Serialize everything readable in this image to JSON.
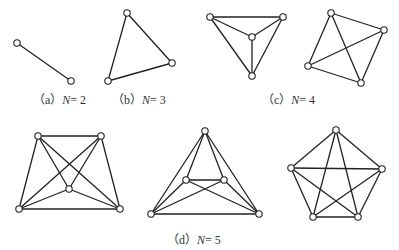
{
  "colors": {
    "line": "#222222",
    "node_fill": "#ffffff",
    "text": "#333333"
  },
  "node_radius": 3.2,
  "captions": [
    {
      "id": "a",
      "prefix": "（a）",
      "var": "N",
      "suffix": "= 2",
      "x": 33,
      "y": 104
    },
    {
      "id": "b",
      "prefix": "（b）",
      "var": "N",
      "suffix": "= 3",
      "x": 112,
      "y": 104
    },
    {
      "id": "c",
      "prefix": "（c）",
      "var": "N",
      "suffix": "= 4",
      "x": 262,
      "y": 104
    },
    {
      "id": "d",
      "prefix": "（d）",
      "var": "N",
      "suffix": "= 5",
      "x": 167,
      "y": 244
    }
  ],
  "graphs": [
    {
      "name": "graph-n2",
      "nodes": [
        [
          17,
          43
        ],
        [
          71,
          81
        ]
      ],
      "edges": [
        [
          0,
          1
        ]
      ]
    },
    {
      "name": "graph-n3",
      "nodes": [
        [
          127,
          13
        ],
        [
          172,
          63
        ],
        [
          108,
          81
        ]
      ],
      "edges": [
        [
          0,
          1
        ],
        [
          1,
          2
        ],
        [
          2,
          0
        ]
      ]
    },
    {
      "name": "graph-n4-planar",
      "nodes": [
        [
          210,
          17
        ],
        [
          283,
          17
        ],
        [
          252,
          37
        ],
        [
          252,
          76
        ]
      ],
      "edges": [
        [
          0,
          1
        ],
        [
          0,
          2
        ],
        [
          0,
          3
        ],
        [
          1,
          2
        ],
        [
          1,
          3
        ],
        [
          2,
          3
        ]
      ]
    },
    {
      "name": "graph-n4-square",
      "nodes": [
        [
          331,
          13
        ],
        [
          384,
          30
        ],
        [
          308,
          66
        ],
        [
          361,
          83
        ]
      ],
      "edges": [
        [
          0,
          1
        ],
        [
          0,
          2
        ],
        [
          0,
          3
        ],
        [
          1,
          2
        ],
        [
          1,
          3
        ],
        [
          2,
          3
        ]
      ]
    },
    {
      "name": "graph-n5-trapezoid",
      "nodes": [
        [
          38,
          136
        ],
        [
          101,
          136
        ],
        [
          69,
          189
        ],
        [
          19,
          209
        ],
        [
          120,
          209
        ]
      ],
      "edges": [
        [
          0,
          1
        ],
        [
          0,
          2
        ],
        [
          0,
          3
        ],
        [
          0,
          4
        ],
        [
          1,
          2
        ],
        [
          1,
          3
        ],
        [
          1,
          4
        ],
        [
          2,
          3
        ],
        [
          2,
          4
        ],
        [
          3,
          4
        ]
      ]
    },
    {
      "name": "graph-n5-triangle",
      "nodes": [
        [
          205,
          131
        ],
        [
          186,
          180
        ],
        [
          224,
          180
        ],
        [
          151,
          214
        ],
        [
          259,
          214
        ]
      ],
      "edges": [
        [
          0,
          1
        ],
        [
          0,
          2
        ],
        [
          0,
          3
        ],
        [
          0,
          4
        ],
        [
          1,
          2
        ],
        [
          1,
          3
        ],
        [
          1,
          4
        ],
        [
          2,
          3
        ],
        [
          2,
          4
        ],
        [
          3,
          4
        ]
      ]
    },
    {
      "name": "graph-n5-pentagon",
      "nodes": [
        [
          336,
          130
        ],
        [
          382,
          169
        ],
        [
          358,
          217
        ],
        [
          313,
          217
        ],
        [
          291,
          168
        ]
      ],
      "edges": [
        [
          0,
          1
        ],
        [
          0,
          2
        ],
        [
          0,
          3
        ],
        [
          0,
          4
        ],
        [
          1,
          2
        ],
        [
          1,
          3
        ],
        [
          1,
          4
        ],
        [
          2,
          3
        ],
        [
          2,
          4
        ],
        [
          3,
          4
        ]
      ]
    }
  ]
}
